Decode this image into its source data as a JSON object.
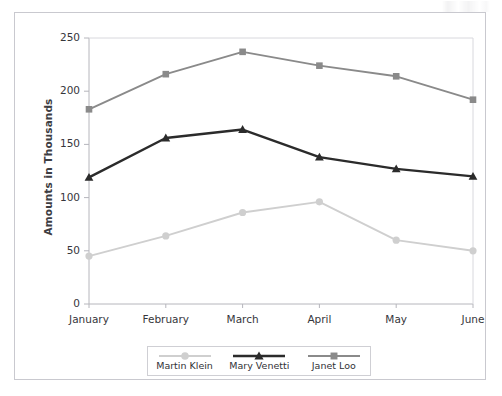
{
  "figure": {
    "background_color": "#ffffff",
    "border_color": "#c9c9cf",
    "artifact_name": "scan-artifact"
  },
  "chart_data": {
    "type": "line",
    "title": "",
    "xlabel": "",
    "ylabel": "Amounts in Thousands",
    "categories": [
      "January",
      "February",
      "March",
      "April",
      "May",
      "June"
    ],
    "ylim": [
      0,
      250
    ],
    "yticks": [
      0,
      50,
      100,
      150,
      200,
      250
    ],
    "grid": false,
    "legend_position": "bottom",
    "series": [
      {
        "name": "Martin Klein",
        "marker": "circle",
        "color": "#cfcfcf",
        "values": [
          45,
          64,
          86,
          96,
          60,
          50
        ]
      },
      {
        "name": "Mary Venetti",
        "marker": "triangle",
        "color": "#2b2b2b",
        "values": [
          119,
          156,
          164,
          138,
          127,
          120
        ]
      },
      {
        "name": "Janet Loo",
        "marker": "square",
        "color": "#8a8a8a",
        "values": [
          183,
          216,
          237,
          224,
          214,
          192
        ]
      }
    ]
  },
  "legend": {
    "items": [
      {
        "label": "Martin Klein"
      },
      {
        "label": "Mary Venetti"
      },
      {
        "label": "Janet Loo"
      }
    ]
  },
  "axis": {
    "y_tick_labels": [
      "250",
      "200",
      "150",
      "100",
      "50",
      "0"
    ],
    "x_tick_labels": [
      "January",
      "February",
      "March",
      "April",
      "May",
      "June"
    ]
  }
}
